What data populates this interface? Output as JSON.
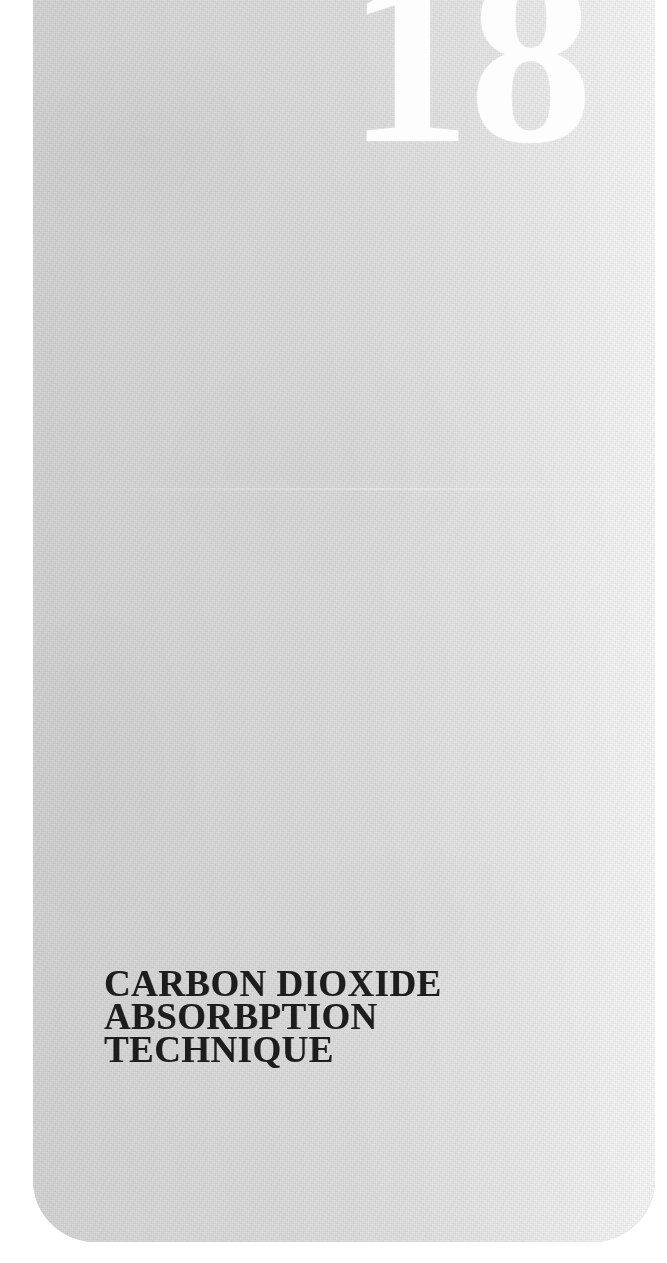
{
  "document": {
    "type": "book-chapter-divider-scan",
    "page_background_color": "#ffffff",
    "sheet_color_left": "#d2d3d2",
    "sheet_color_right": "#f6f7f6",
    "ink_color": "#1b1b1b",
    "knockout_color": "#fdfdfd"
  },
  "chapter": {
    "number": "18",
    "title_lines": [
      "CARBON DIOXIDE",
      "ABSORBPTION",
      "TECHNIQUE"
    ],
    "title_full": "CARBON DIOXIDE ABSORBPTION TECHNIQUE"
  }
}
